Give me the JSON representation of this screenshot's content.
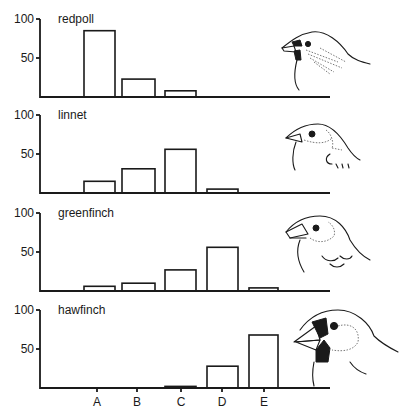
{
  "chart_data": {
    "type": "bar",
    "layout": "four vertically stacked small-multiple panels sharing x categories",
    "categories": [
      "A",
      "B",
      "C",
      "D",
      "E"
    ],
    "ylim": [
      0,
      100
    ],
    "yticks": [
      "100",
      "50"
    ],
    "xlabel": "",
    "ylabel": "",
    "grid": false,
    "series": [
      {
        "name": "redpoll",
        "values": [
          85,
          23,
          8,
          0,
          0
        ]
      },
      {
        "name": "linnet",
        "values": [
          15,
          31,
          56,
          5,
          0
        ]
      },
      {
        "name": "greenfinch",
        "values": [
          6,
          10,
          27,
          56,
          4
        ]
      },
      {
        "name": "hawfinch",
        "values": [
          0,
          0,
          2,
          28,
          68
        ]
      }
    ],
    "annotations": [
      "redpoll head illustration",
      "linnet head illustration",
      "greenfinch head illustration",
      "hawfinch head illustration"
    ]
  },
  "colors": {
    "ink": "#1a1a1a",
    "background": "#ffffff"
  }
}
